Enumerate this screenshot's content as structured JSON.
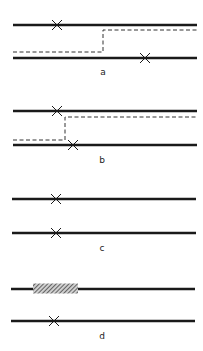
{
  "figure": {
    "colors": {
      "line": "#1a1a1a",
      "dashed": "#333333",
      "background": "#ffffff"
    },
    "panels": [
      {
        "id": "a",
        "label": "a",
        "top_line_y": 25,
        "bottom_line_y": 58,
        "top_cross_x": 57,
        "bottom_cross_x": 145,
        "dashed_path": {
          "upper_y": 30,
          "lower_y": 52,
          "switch_x": 103
        },
        "label_pos": [
          103,
          75
        ]
      },
      {
        "id": "b",
        "label": "b",
        "top_line_y": 111,
        "bottom_line_y": 145,
        "top_cross_x": 57,
        "bottom_cross_x": 73,
        "dashed_path": {
          "upper_y": 117,
          "lower_y": 140,
          "switch_x": 65
        },
        "label_pos": [
          102,
          163
        ]
      },
      {
        "id": "c",
        "label": "c",
        "top_line_y": 199,
        "bottom_line_y": 233,
        "top_cross_x": 56,
        "bottom_cross_x": 56,
        "label_pos": [
          102,
          251
        ]
      },
      {
        "id": "d",
        "label": "d",
        "top_line_y": 289,
        "bottom_line_y": 321,
        "bottom_cross_x": 54,
        "hatched_region": {
          "x_start": 33,
          "x_end": 78
        },
        "label_pos": [
          102,
          339
        ]
      }
    ]
  }
}
